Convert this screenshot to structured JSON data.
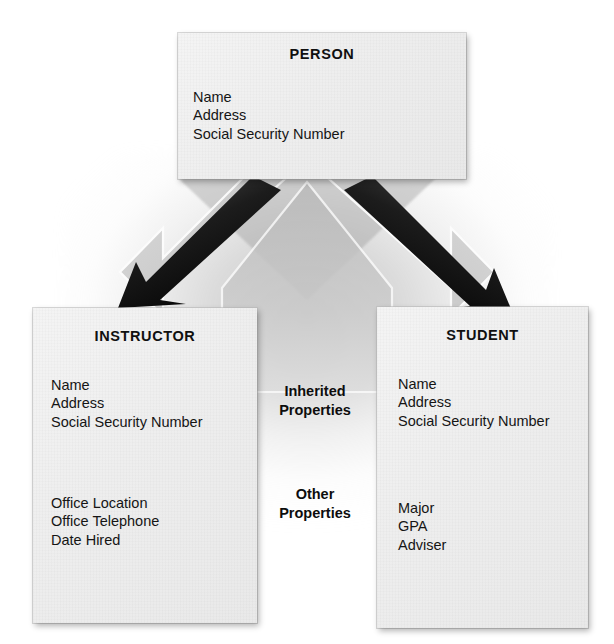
{
  "diagram": {
    "box_fill_color": "#eeeeee",
    "arrow_color": "#111111",
    "text_color": "#151515"
  },
  "boxes": {
    "person": {
      "title": "PERSON",
      "attributes": [
        "Name",
        "Address",
        "Social Security Number"
      ]
    },
    "instructor": {
      "title": "INSTRUCTOR",
      "inherited_attributes": [
        "Name",
        "Address",
        "Social Security Number"
      ],
      "other_attributes": [
        "Office Location",
        "Office Telephone",
        "Date Hired"
      ]
    },
    "student": {
      "title": "STUDENT",
      "inherited_attributes": [
        "Name",
        "Address",
        "Social Security Number"
      ],
      "other_attributes": [
        "Major",
        "GPA",
        "Adviser"
      ]
    }
  },
  "captions": {
    "inherited": "Inherited\nProperties",
    "other": "Other\nProperties"
  },
  "connectors": [
    {
      "name": "person-to-instructor",
      "from": "PERSON",
      "to": "INSTRUCTOR",
      "style": "solid-black-arrow"
    },
    {
      "name": "person-to-student",
      "from": "PERSON",
      "to": "STUDENT",
      "style": "solid-black-arrow"
    }
  ]
}
